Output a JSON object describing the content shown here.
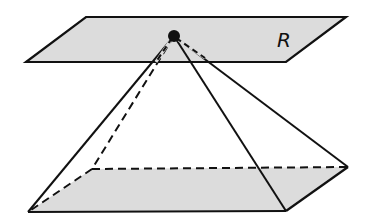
{
  "diagram": {
    "plane_label": "R",
    "plane_fill": "#dcdcdc",
    "base_fill": "#dcdcdc",
    "stroke": "#111111"
  }
}
